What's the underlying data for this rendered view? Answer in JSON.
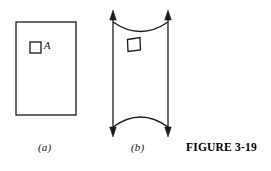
{
  "figure": {
    "caption": "FIGURE 3-19",
    "background_color": "#ffffff",
    "ink_color": "#000000"
  },
  "panel_a": {
    "label": "(a)",
    "element_label": "A",
    "description": "undeformed-rectangular-body-with-small-square-element",
    "outline": {
      "x": 16,
      "y": 22,
      "width": 60,
      "height": 93
    },
    "element_square": {
      "x": 30,
      "y": 42,
      "width": 11,
      "height": 11
    }
  },
  "panel_b": {
    "label": "(b)",
    "description": "deformed-body-under-vertical-tension-with-distorted-square-element",
    "left_edge_x": 113,
    "right_edge_x": 168,
    "top_y": 11,
    "bottom_y": 136,
    "arrow_count": 4,
    "arrow_directions": [
      "up",
      "up",
      "down",
      "down"
    ],
    "element_square": {
      "x": 127,
      "y": 37,
      "width": 13,
      "height": 13
    }
  }
}
